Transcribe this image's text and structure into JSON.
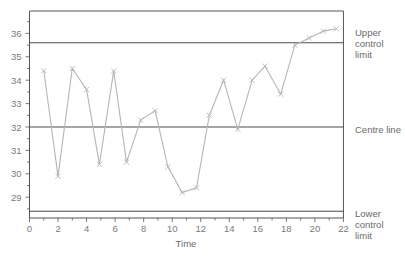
{
  "chart_data": {
    "type": "line",
    "title": "",
    "xlabel": "Time",
    "ylabel": "",
    "xlim": [
      0,
      22
    ],
    "ylim": [
      28.0,
      36.9
    ],
    "x_ticks": [
      0,
      2,
      4,
      6,
      8,
      10,
      12,
      14,
      16,
      18,
      20,
      22
    ],
    "y_ticks": [
      29,
      30,
      31,
      32,
      33,
      34,
      35,
      36
    ],
    "grid": false,
    "legend": null,
    "series": [
      {
        "name": "Process measurement",
        "marker": "x",
        "color": "#b5b5b5",
        "x": [
          1,
          2,
          3,
          4,
          4.9,
          5.9,
          6.8,
          7.8,
          8.8,
          9.7,
          10.7,
          11.7,
          12.6,
          13.6,
          14.6,
          15.6,
          16.5,
          17.6,
          18.6,
          19.6,
          20.6,
          21.5
        ],
        "values": [
          34.4,
          29.9,
          34.5,
          33.6,
          30.4,
          34.4,
          30.5,
          32.3,
          32.7,
          30.3,
          29.2,
          29.4,
          32.5,
          34.0,
          31.9,
          34.0,
          34.6,
          33.4,
          35.5,
          35.8,
          36.1,
          36.2
        ]
      }
    ],
    "reference_lines": [
      {
        "name": "Upper control limit",
        "label_lines": [
          "Upper",
          "control",
          "limit"
        ],
        "y": 35.6,
        "color": "#4a4a4a"
      },
      {
        "name": "Centre line",
        "label_lines": [
          "Centre line"
        ],
        "y": 32.0,
        "color": "#4a4a4a"
      },
      {
        "name": "Lower control limit",
        "label_lines": [
          "Lower",
          "control",
          "limit"
        ],
        "y": 28.4,
        "color": "#4a4a4a"
      }
    ],
    "annotations": [
      "Upper control limit",
      "Centre line",
      "Lower control limit"
    ]
  },
  "labels": {
    "ucl": [
      "Upper",
      "control",
      "limit"
    ],
    "centre": "Centre line",
    "lcl": [
      "Lower",
      "control",
      "limit"
    ],
    "x_title": "Time"
  },
  "colors": {
    "frame": "#555555",
    "ref_line": "#4a4a4a",
    "data_line": "#b5b5b5",
    "tick_text": "#7a7a7a"
  }
}
